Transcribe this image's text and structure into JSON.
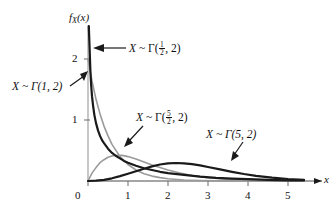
{
  "chart_data": {
    "type": "line",
    "title": "",
    "xlabel": "x",
    "ylabel": "f_X(x)",
    "xlim": [
      0,
      5.5
    ],
    "ylim": [
      0,
      2.55
    ],
    "grid": false,
    "legend_position": "inline-annotations",
    "xticks": [
      "0",
      "1",
      "2",
      "3",
      "4",
      "5"
    ],
    "xtick_values": [
      0,
      1,
      2,
      3,
      4,
      5
    ],
    "yticks": [
      "1",
      "2"
    ],
    "ytick_values": [
      1,
      2
    ],
    "series": [
      {
        "name": "X ~ Γ(1/2, 2)",
        "alpha": 0.5,
        "beta": 2,
        "color": "#1a1a1a",
        "width": 2.2,
        "x": [
          0.02,
          0.04,
          0.06,
          0.08,
          0.1,
          0.13,
          0.16,
          0.2,
          0.25,
          0.3,
          0.35,
          0.4,
          0.5,
          0.6,
          0.7,
          0.8,
          0.9,
          1.0,
          1.2,
          1.4,
          1.6,
          1.8,
          2.0,
          2.4,
          2.8,
          3.2,
          3.6,
          4.0,
          4.5,
          5.0,
          5.4
        ],
        "values": [
          2.75,
          2.18,
          1.8,
          1.56,
          1.39,
          1.22,
          1.08,
          0.95,
          0.83,
          0.74,
          0.67,
          0.62,
          0.53,
          0.46,
          0.41,
          0.37,
          0.33,
          0.3,
          0.25,
          0.21,
          0.18,
          0.15,
          0.13,
          0.1,
          0.07,
          0.05,
          0.04,
          0.03,
          0.02,
          0.01,
          0.01
        ]
      },
      {
        "name": "X ~ Γ(1, 2)",
        "alpha": 1,
        "beta": 2,
        "color": "#9a9a9a",
        "width": 1.6,
        "x": [
          0,
          0.1,
          0.2,
          0.3,
          0.4,
          0.5,
          0.6,
          0.8,
          1.0,
          1.2,
          1.4,
          1.6,
          1.8,
          2.0,
          2.4,
          2.8,
          3.2,
          3.6,
          4.0,
          4.5,
          5.0,
          5.4
        ],
        "values": [
          2.0,
          1.64,
          1.34,
          1.1,
          0.9,
          0.74,
          0.6,
          0.4,
          0.27,
          0.18,
          0.12,
          0.08,
          0.055,
          0.037,
          0.017,
          0.008,
          0.003,
          0.002,
          0.001,
          0.0005,
          0.0002,
          0.0001
        ]
      },
      {
        "name": "X ~ Γ(5/2, 2)",
        "alpha": 2.5,
        "beta": 2,
        "color": "#9a9a9a",
        "width": 1.6,
        "x": [
          0,
          0.1,
          0.2,
          0.3,
          0.4,
          0.5,
          0.6,
          0.7,
          0.85,
          1.0,
          1.2,
          1.4,
          1.6,
          1.8,
          2.0,
          2.3,
          2.6,
          3.0,
          3.4,
          3.8,
          4.2,
          4.6,
          5.0,
          5.4
        ],
        "values": [
          0,
          0.13,
          0.22,
          0.3,
          0.35,
          0.39,
          0.41,
          0.42,
          0.42,
          0.4,
          0.36,
          0.31,
          0.26,
          0.22,
          0.18,
          0.13,
          0.09,
          0.055,
          0.033,
          0.019,
          0.011,
          0.006,
          0.003,
          0.002
        ]
      },
      {
        "name": "X ~ Γ(5, 2)",
        "alpha": 5,
        "beta": 2,
        "color": "#1a1a1a",
        "width": 2.2,
        "x": [
          0,
          0.2,
          0.4,
          0.6,
          0.8,
          1.0,
          1.2,
          1.4,
          1.6,
          1.8,
          2.0,
          2.2,
          2.4,
          2.6,
          2.8,
          3.0,
          3.3,
          3.6,
          3.9,
          4.2,
          4.6,
          5.0,
          5.4
        ],
        "values": [
          0,
          0.006,
          0.02,
          0.045,
          0.08,
          0.12,
          0.16,
          0.2,
          0.24,
          0.27,
          0.29,
          0.295,
          0.29,
          0.275,
          0.255,
          0.23,
          0.19,
          0.15,
          0.115,
          0.085,
          0.055,
          0.032,
          0.018
        ]
      }
    ],
    "annotations": [
      {
        "id": "annot-gamma-half-2",
        "parts": {
          "variable": "X",
          "tilde": "~",
          "gamma": "Γ",
          "open": "(",
          "num": "1",
          "den": "2",
          "comma": ", ",
          "beta": "2",
          "close": ")"
        },
        "plain": "X ~ Γ(1/2, 2)",
        "points_to": "gamma-half-2-curve"
      },
      {
        "id": "annot-gamma-1-2",
        "parts": {
          "variable": "X",
          "tilde": "~",
          "gamma": "Γ",
          "open": "(",
          "alpha": "1",
          "comma": ", ",
          "beta": "2",
          "close": ")"
        },
        "plain": "X ~ Γ(1, 2)",
        "points_to": "gamma-1-2-curve"
      },
      {
        "id": "annot-gamma-fivehalf-2",
        "parts": {
          "variable": "X",
          "tilde": "~",
          "gamma": "Γ",
          "open": "(",
          "num": "5",
          "den": "2",
          "comma": ", ",
          "beta": "2",
          "close": ")"
        },
        "plain": "X ~ Γ(5/2, 2)",
        "points_to": "gamma-fivehalf-2-curve"
      },
      {
        "id": "annot-gamma-5-2",
        "parts": {
          "variable": "X",
          "tilde": "~",
          "gamma": "Γ",
          "open": "(",
          "alpha": "5",
          "comma": ", ",
          "beta": "2",
          "close": ")"
        },
        "plain": "X ~ Γ(5, 2)",
        "points_to": "gamma-5-2-curve"
      }
    ]
  },
  "axis": {
    "y_label_f": "f",
    "y_label_sub": "X",
    "y_label_arg": "(x)",
    "x_label": "x"
  },
  "ticks": {
    "x": [
      "0",
      "1",
      "2",
      "3",
      "4",
      "5"
    ],
    "y": [
      "1",
      "2"
    ]
  },
  "annotation_text": {
    "half_2": {
      "var": "X",
      "tilde": "~",
      "gamma": "Γ(",
      "num": "1",
      "den": "2",
      "tail": ", 2)"
    },
    "one_2": {
      "full": "X ~ Γ(1, 2)"
    },
    "fivehalf_2": {
      "var": "X",
      "tilde": "~",
      "gamma": "Γ(",
      "num": "5",
      "den": "2",
      "tail": ", 2)"
    },
    "five_2": {
      "full": "X ~ Γ(5, 2)"
    }
  },
  "colors": {
    "curve_dark": "#1a1a1a",
    "curve_gray": "#9a9a9a",
    "axis": "#4d4d4d",
    "background": "#ffffff",
    "text": "#111111"
  }
}
